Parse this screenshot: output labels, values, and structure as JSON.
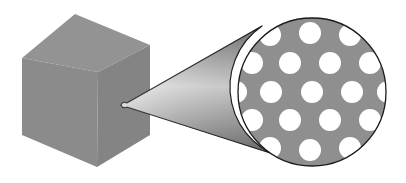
{
  "diagram": {
    "colors": {
      "background": "#ffffff",
      "cube_top": "#939393",
      "cube_left": "#8b8b8b",
      "cube_right": "#848484",
      "cone_light": "#e6e6e6",
      "cone_dark": "#6e6e6e",
      "inset_fill": "#8f8f8f",
      "hole_fill": "#ffffff",
      "outline": "#1a1a1a"
    },
    "cube": {
      "vertices": {
        "top": [
          75,
          14
        ],
        "left_top": [
          22,
          58
        ],
        "center": [
          98,
          72
        ],
        "right_top": [
          150,
          45
        ],
        "left_bottom": [
          22,
          135
        ],
        "bottom": [
          97,
          167
        ],
        "right_bottom": [
          150,
          135
        ]
      }
    },
    "cone": {
      "tip": [
        123,
        105
      ],
      "top_tangent": [
        262,
        26
      ],
      "bottom_tangent": [
        292,
        160
      ]
    },
    "inset": {
      "center": [
        312,
        92
      ],
      "radius": 74,
      "hole_radius": 11,
      "holes": [
        [
          270,
          35
        ],
        [
          310,
          33
        ],
        [
          350,
          35
        ],
        [
          252,
          63
        ],
        [
          290,
          63
        ],
        [
          330,
          63
        ],
        [
          370,
          63
        ],
        [
          236,
          92
        ],
        [
          271,
          92
        ],
        [
          312,
          92
        ],
        [
          352,
          92
        ],
        [
          388,
          92
        ],
        [
          252,
          120
        ],
        [
          290,
          120
        ],
        [
          330,
          120
        ],
        [
          370,
          120
        ],
        [
          270,
          148
        ],
        [
          310,
          150
        ],
        [
          350,
          148
        ]
      ]
    }
  }
}
